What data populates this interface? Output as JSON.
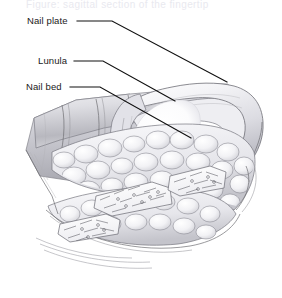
{
  "figure": {
    "title_cut_off": "Figure: sagittal section of the fingertip",
    "alt": "Grayscale anatomical illustration of a fingertip in sagittal cross-section showing the nail plate, lunula, nail bed, fat lobules and distal phalanx",
    "width": 282,
    "height": 298,
    "background_color": "#ffffff",
    "line_color": "#101010"
  },
  "labels": [
    {
      "id": "nail-plate",
      "text": "Nail plate",
      "text_x": 27,
      "text_y": 24,
      "leader": "M 77 21 L 112 21 L 227 82",
      "target_x": 227,
      "target_y": 82
    },
    {
      "id": "lunula",
      "text": "Lunula",
      "text_x": 38,
      "text_y": 64,
      "leader": "M 74 61 L 103 61 L 175 101",
      "target_x": 175,
      "target_y": 101
    },
    {
      "id": "nail-bed",
      "text": "Nail bed",
      "text_x": 26,
      "text_y": 90,
      "leader": "M 70 87 L 100 87 L 191 138",
      "target_x": 191,
      "target_y": 138
    }
  ],
  "anatomy": {
    "parts": [
      "nail-plate",
      "lunula",
      "nail-bed",
      "proximal-nail-fold",
      "eponychium",
      "hyponychium",
      "fat-lobules",
      "distal-phalanx",
      "skin-creases"
    ],
    "palette": {
      "paper": "#ffffff",
      "skin_light": "#f4f4f6",
      "skin_mid": "#d8d8dd",
      "skin_dark": "#a9a9b0",
      "nail_highlight": "#fbfbfd",
      "lunula": "#ffffff",
      "fat_fill": "#f2f2f5",
      "bone_fill": "#fafafc",
      "outline": "#6e6e72"
    }
  }
}
